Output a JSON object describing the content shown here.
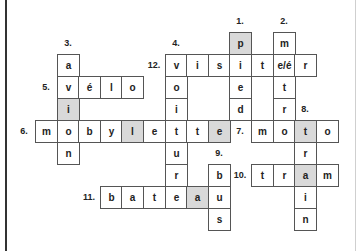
{
  "puzzle": {
    "cell_size": 21.6,
    "row_height": 22,
    "origin_x": 35,
    "origin_y": 32,
    "shade_color": "#d9d9d9",
    "cells": [
      {
        "r": 0,
        "c": 9,
        "ch": "p",
        "shaded": true
      },
      {
        "r": 0,
        "c": 11,
        "ch": "m"
      },
      {
        "r": 1,
        "c": 1,
        "ch": "a"
      },
      {
        "r": 1,
        "c": 6,
        "ch": "v"
      },
      {
        "r": 1,
        "c": 7,
        "ch": "i"
      },
      {
        "r": 1,
        "c": 8,
        "ch": "s"
      },
      {
        "r": 1,
        "c": 9,
        "ch": "i"
      },
      {
        "r": 1,
        "c": 10,
        "ch": "t"
      },
      {
        "r": 1,
        "c": 11,
        "ch": "e/é"
      },
      {
        "r": 1,
        "c": 12,
        "ch": "r"
      },
      {
        "r": 2,
        "c": 1,
        "ch": "v"
      },
      {
        "r": 2,
        "c": 2,
        "ch": "é"
      },
      {
        "r": 2,
        "c": 3,
        "ch": "l"
      },
      {
        "r": 2,
        "c": 4,
        "ch": "o"
      },
      {
        "r": 2,
        "c": 6,
        "ch": "o"
      },
      {
        "r": 2,
        "c": 9,
        "ch": "e"
      },
      {
        "r": 2,
        "c": 11,
        "ch": "t"
      },
      {
        "r": 3,
        "c": 1,
        "ch": "i",
        "shaded": true
      },
      {
        "r": 3,
        "c": 6,
        "ch": "i"
      },
      {
        "r": 3,
        "c": 9,
        "ch": "d"
      },
      {
        "r": 3,
        "c": 11,
        "ch": "r"
      },
      {
        "r": 4,
        "c": 0,
        "ch": "m"
      },
      {
        "r": 4,
        "c": 1,
        "ch": "o"
      },
      {
        "r": 4,
        "c": 2,
        "ch": "b"
      },
      {
        "r": 4,
        "c": 3,
        "ch": "y"
      },
      {
        "r": 4,
        "c": 4,
        "ch": "l",
        "shaded": true
      },
      {
        "r": 4,
        "c": 5,
        "ch": "e"
      },
      {
        "r": 4,
        "c": 6,
        "ch": "t"
      },
      {
        "r": 4,
        "c": 7,
        "ch": "t"
      },
      {
        "r": 4,
        "c": 8,
        "ch": "e",
        "shaded": true
      },
      {
        "r": 4,
        "c": 10,
        "ch": "m"
      },
      {
        "r": 4,
        "c": 11,
        "ch": "o"
      },
      {
        "r": 4,
        "c": 12,
        "ch": "t",
        "shaded": true
      },
      {
        "r": 4,
        "c": 13,
        "ch": "o"
      },
      {
        "r": 5,
        "c": 1,
        "ch": "n"
      },
      {
        "r": 5,
        "c": 6,
        "ch": "u"
      },
      {
        "r": 5,
        "c": 12,
        "ch": "r"
      },
      {
        "r": 6,
        "c": 6,
        "ch": "r"
      },
      {
        "r": 6,
        "c": 8,
        "ch": "b"
      },
      {
        "r": 6,
        "c": 10,
        "ch": "t"
      },
      {
        "r": 6,
        "c": 11,
        "ch": "r"
      },
      {
        "r": 6,
        "c": 12,
        "ch": "a",
        "shaded": true
      },
      {
        "r": 6,
        "c": 13,
        "ch": "m"
      },
      {
        "r": 7,
        "c": 3,
        "ch": "b"
      },
      {
        "r": 7,
        "c": 4,
        "ch": "a"
      },
      {
        "r": 7,
        "c": 5,
        "ch": "t"
      },
      {
        "r": 7,
        "c": 6,
        "ch": "e"
      },
      {
        "r": 7,
        "c": 7,
        "ch": "a",
        "shaded": true
      },
      {
        "r": 7,
        "c": 8,
        "ch": "u"
      },
      {
        "r": 7,
        "c": 12,
        "ch": "i"
      },
      {
        "r": 8,
        "c": 8,
        "ch": "s"
      },
      {
        "r": 8,
        "c": 12,
        "ch": "n"
      }
    ],
    "numbers": [
      {
        "label": "1.",
        "r": -1,
        "c": 9
      },
      {
        "label": "2.",
        "r": -1,
        "c": 11
      },
      {
        "label": "3.",
        "r": 0,
        "c": 1
      },
      {
        "label": "4.",
        "r": 0,
        "c": 6
      },
      {
        "label": "12.",
        "r": 1,
        "c": 5
      },
      {
        "label": "5.",
        "r": 2,
        "c": 0
      },
      {
        "label": "8.",
        "r": 3,
        "c": 12
      },
      {
        "label": "6.",
        "r": 4,
        "c": -1
      },
      {
        "label": "7.",
        "r": 4,
        "c": 9
      },
      {
        "label": "9.",
        "r": 5,
        "c": 8
      },
      {
        "label": "10.",
        "r": 6,
        "c": 9
      },
      {
        "label": "11.",
        "r": 7,
        "c": 2
      }
    ]
  }
}
